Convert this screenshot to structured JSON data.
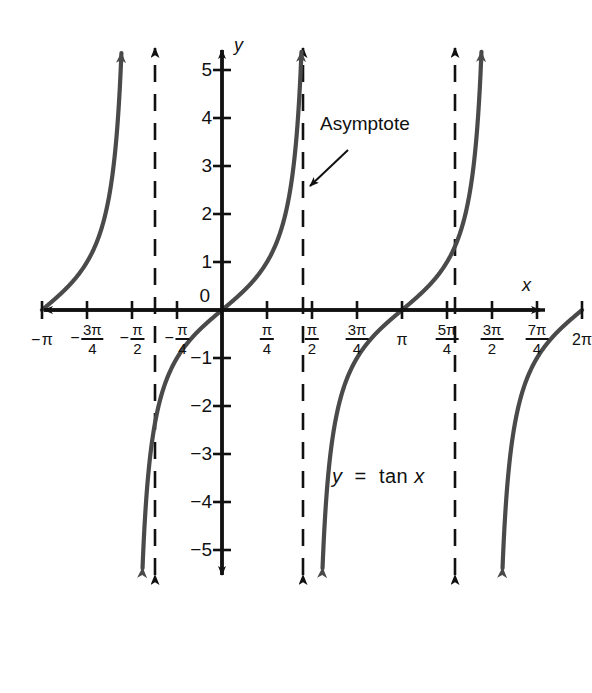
{
  "figure": {
    "type": "math-graph",
    "equation_label": "y  =  tan x",
    "annotation": "Asymptote",
    "axis_labels": {
      "x": "x",
      "y": "y"
    },
    "background_color": "#ffffff",
    "axis_color": "#111111",
    "curve_color": "#4a4a4a",
    "asymptote_color": "#111111"
  },
  "chart_data": {
    "type": "line",
    "xlabel": "x",
    "ylabel": "y",
    "xlim": [
      -3.4557,
      6.8068
    ],
    "ylim": [
      -5.6,
      5.6
    ],
    "grid": false,
    "legend": "none",
    "annotations": [
      {
        "text": "Asymptote",
        "target_x": 1.5708,
        "target_y": 2.2,
        "text_x": 2.1,
        "text_y": 3.3
      },
      {
        "text": "y  =  tan x",
        "text_x": 2.6,
        "text_y": -3.6
      }
    ],
    "asymptotes": [
      {
        "x_value": -1.5708,
        "label": "-π/2"
      },
      {
        "x_value": 1.5708,
        "label": "π/2"
      },
      {
        "x_value": 4.7124,
        "label": "3π/2"
      }
    ],
    "x_ticks": [
      {
        "value": -3.1416,
        "label": "− π",
        "sign": "-",
        "num": "π",
        "den": "",
        "style": "plain"
      },
      {
        "value": -2.3562,
        "label": "− 3π/4",
        "sign": "-",
        "num": "3π",
        "den": "4",
        "style": "frac"
      },
      {
        "value": -1.5708,
        "label": "− π/2",
        "sign": "-",
        "num": "π",
        "den": "2",
        "style": "frac"
      },
      {
        "value": -0.7854,
        "label": "− π/4",
        "sign": "-",
        "num": "π",
        "den": "4",
        "style": "frac"
      },
      {
        "value": 0.7854,
        "label": "π/4",
        "sign": "",
        "num": "π",
        "den": "4",
        "style": "frac"
      },
      {
        "value": 1.5708,
        "label": "π/2",
        "sign": "",
        "num": "π",
        "den": "2",
        "style": "frac"
      },
      {
        "value": 2.3562,
        "label": "3π/4",
        "sign": "",
        "num": "3π",
        "den": "4",
        "style": "frac"
      },
      {
        "value": 3.1416,
        "label": "π",
        "sign": "",
        "num": "π",
        "den": "",
        "style": "plain"
      },
      {
        "value": 3.927,
        "label": "5π/4",
        "sign": "",
        "num": "5π",
        "den": "4",
        "style": "frac"
      },
      {
        "value": 4.7124,
        "label": "3π/2",
        "sign": "",
        "num": "3π",
        "den": "2",
        "style": "frac"
      },
      {
        "value": 5.4978,
        "label": "7π/4",
        "sign": "",
        "num": "7π",
        "den": "4",
        "style": "frac"
      },
      {
        "value": 6.2832,
        "label": "2π",
        "sign": "",
        "num": "2π",
        "den": "",
        "style": "plain"
      }
    ],
    "y_ticks": [
      {
        "value": 5,
        "label": "5"
      },
      {
        "value": 4,
        "label": "4"
      },
      {
        "value": 3,
        "label": "3"
      },
      {
        "value": 2,
        "label": "2"
      },
      {
        "value": 1,
        "label": "1"
      },
      {
        "value": 0,
        "label": "0"
      },
      {
        "value": -1,
        "label": "−1"
      },
      {
        "value": -2,
        "label": "−2"
      },
      {
        "value": -3,
        "label": "−3"
      },
      {
        "value": -4,
        "label": "−4"
      },
      {
        "value": -5,
        "label": "−5"
      }
    ],
    "series": [
      {
        "name": "branch -pi..-pi/2",
        "x_start": -3.1416,
        "x_end": -1.5708
      },
      {
        "name": "branch -pi/2..pi/2",
        "x_start": -1.5708,
        "x_end": 1.5708
      },
      {
        "name": "branch pi/2..3pi/2",
        "x_start": 1.5708,
        "x_end": 4.7124
      },
      {
        "name": "branch 3pi/2..2pi",
        "x_start": 4.7124,
        "x_end": 6.2832
      }
    ]
  }
}
